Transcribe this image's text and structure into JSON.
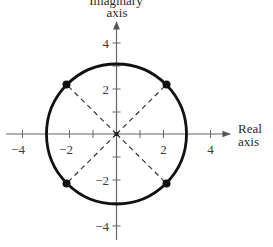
{
  "diagram": {
    "type": "complex-plane",
    "y_axis_label_line1": "Imaginary",
    "y_axis_label_line2": "axis",
    "x_axis_label_line1": "Real",
    "x_axis_label_line2": "axis",
    "x_ticks": [
      {
        "value": -4,
        "label": "−4"
      },
      {
        "value": -2,
        "label": "−2"
      },
      {
        "value": 2,
        "label": "2"
      },
      {
        "value": 4,
        "label": "4"
      }
    ],
    "y_ticks": [
      {
        "value": 4,
        "label": "4"
      },
      {
        "value": 2,
        "label": "2"
      },
      {
        "value": -2,
        "label": "−2"
      },
      {
        "value": -4,
        "label": "−4"
      }
    ],
    "circle": {
      "center": [
        0,
        0
      ],
      "radius": 3
    },
    "points": [
      {
        "x": 2.12,
        "y": 2.12
      },
      {
        "x": -2.12,
        "y": 2.12
      },
      {
        "x": -2.12,
        "y": -2.12
      },
      {
        "x": 2.12,
        "y": -2.12
      }
    ],
    "dashed_lines": "diagonals from origin to each point",
    "colors": {
      "curve": "#111111",
      "axes": "#555555",
      "text": "#2a2a2a"
    }
  }
}
